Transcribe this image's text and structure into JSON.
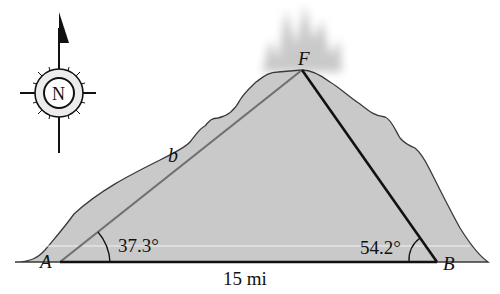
{
  "diagram": {
    "type": "geometry-triangle-word-problem",
    "vertices": {
      "A": {
        "label": "A",
        "x": 60,
        "y": 262
      },
      "B": {
        "label": "B",
        "x": 437,
        "y": 262
      },
      "F": {
        "label": "F",
        "x": 302,
        "y": 70
      }
    },
    "side_AB_label": "15 mi",
    "side_AF_label": "b",
    "angle_A_label": "37.3°",
    "angle_B_label": "54.2°",
    "compass_label": "N"
  },
  "colors": {
    "mountain_fill": "#c9c9c9",
    "mountain_outline": "#3a3a3a",
    "line_AF": "#6e6e6e",
    "line_FB": "#111111",
    "line_AB": "#111111",
    "smoke": "#b9b9b9"
  }
}
